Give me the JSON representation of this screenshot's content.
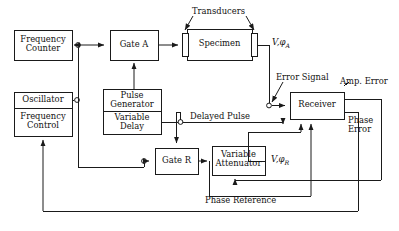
{
  "diagram": {
    "stroke_color": "#1a1a1a",
    "background_color": "#ffffff",
    "boxes": [
      {
        "id": "frequency-counter",
        "label_line1": "Frequency",
        "label_line2": "Counter"
      },
      {
        "id": "oscillator",
        "label_line1": "Oscillator",
        "label_line2": "Frequency",
        "label_line3": "Control"
      },
      {
        "id": "gate-a",
        "label_line1": "Gate A"
      },
      {
        "id": "specimen",
        "label_line1": "Specimen"
      },
      {
        "id": "pulse-generator",
        "label_line1": "Pulse",
        "label_line2": "Generator",
        "label_line3": "Variable",
        "label_line4": "Delay"
      },
      {
        "id": "gate-r",
        "label_line1": "Gate R"
      },
      {
        "id": "variable-attenuator",
        "label_line1": "Variable",
        "label_line2": "Attenuator"
      },
      {
        "id": "receiver",
        "label_line1": "Receiver"
      }
    ],
    "labels": {
      "transducers": "Transducers",
      "error_signal": "Error Signal",
      "amp_error": "Amp. Error",
      "phase_error_line1": "Phase",
      "phase_error_line2": "Error",
      "delayed_pulse": "Delayed Pulse",
      "phase_reference": "Phase Reference",
      "signal_a_v": "V",
      "signal_a_phi": ",φ",
      "signal_a_sub": "A",
      "signal_r_v": "V",
      "signal_r_phi": ",φ",
      "signal_r_sub": "R"
    }
  }
}
